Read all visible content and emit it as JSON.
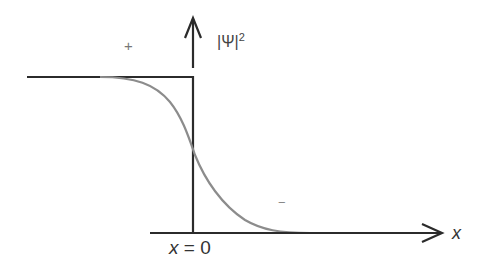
{
  "diagram": {
    "colors": {
      "axis": "#2b2b2b",
      "step": "#2b2b2b",
      "curve": "#8c8c8c",
      "background": "#ffffff"
    },
    "labels": {
      "plus": "+",
      "minus": "−",
      "y_axis": "|Ψ|",
      "y_axis_sup": "2",
      "origin_var": "x",
      "origin_eq": " = 0",
      "x_axis": "x"
    },
    "geometry": {
      "step_top_y": 77,
      "baseline_y": 233,
      "step_left_x": 27,
      "step_x": 193,
      "x_axis_start": 150,
      "x_axis_end": 442,
      "y_arrow_tip": 18,
      "curve_mid_y": 155
    }
  }
}
